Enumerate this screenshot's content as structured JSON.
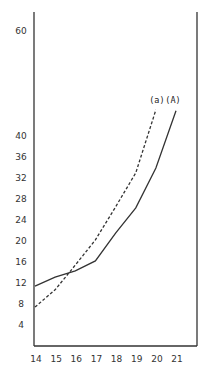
{
  "chart_data": {
    "type": "line",
    "title": "",
    "xlabel": "",
    "ylabel": "",
    "x": [
      14,
      15,
      16,
      17,
      18,
      19,
      20,
      21
    ],
    "x_ticks": [
      "14",
      "15",
      "16",
      "17",
      "18",
      "19",
      "20",
      "21"
    ],
    "y_ticks": [
      "4",
      "8",
      "12",
      "16",
      "20",
      "24",
      "28",
      "32",
      "36",
      "40",
      "60"
    ],
    "xlim": [
      14,
      21.8
    ],
    "ylim": [
      0,
      66
    ],
    "grid": false,
    "legend": "inline labels at curve ends",
    "series": [
      {
        "name": "(A)",
        "style": "solid",
        "x": [
          14,
          15,
          16,
          17,
          18,
          19,
          20,
          21
        ],
        "values": [
          11.4,
          13.1,
          14.3,
          16.2,
          21.5,
          26.3,
          33.9,
          44.8
        ]
      },
      {
        "name": "(a)",
        "style": "dashed",
        "x": [
          14,
          15,
          16,
          17,
          18,
          19,
          20
        ],
        "values": [
          7.4,
          10.7,
          15.4,
          20.2,
          26.5,
          33.0,
          45.0
        ]
      }
    ]
  },
  "colors": {
    "line": "#333333",
    "axis": "#333333",
    "background": "#ffffff"
  }
}
